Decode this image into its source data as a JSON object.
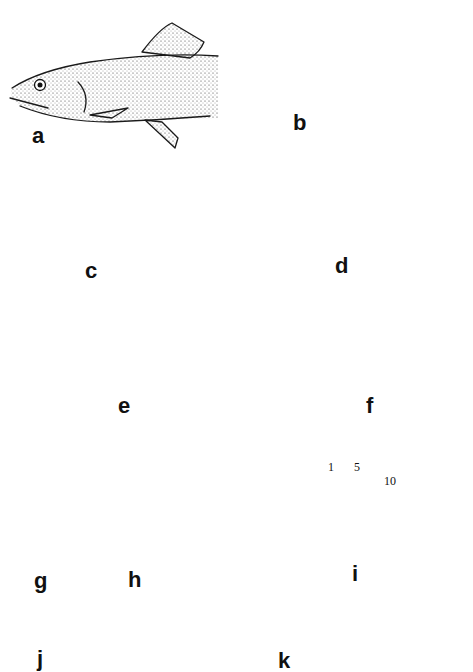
{
  "figure": {
    "type": "scientific-illustration-plate",
    "panels": [
      {
        "id": "a",
        "label": "a",
        "depicts": "head and anterior body of trout, fine stippling"
      },
      {
        "id": "b",
        "label": "b",
        "depicts": "head and anterior body of trout, spotted"
      },
      {
        "id": "c",
        "label": "c",
        "depicts": "outline of caudal region, shallow-forked tail"
      },
      {
        "id": "d",
        "label": "d",
        "depicts": "outline of caudal region, deeply forked tail"
      },
      {
        "id": "e",
        "label": "e",
        "depicts": "caudal peduncle with sparse ocellated spots"
      },
      {
        "id": "f",
        "label": "f",
        "depicts": "caudal peduncle with dense dark spots extending onto tail"
      },
      {
        "id": "g",
        "label": "g",
        "depicts": "gill arch with long rakers"
      },
      {
        "id": "h",
        "label": "h",
        "depicts": "gill arch with short rakers"
      },
      {
        "id": "i",
        "label": "i",
        "depicts": "scale rows counted above lateral line"
      },
      {
        "id": "j",
        "label": "j",
        "depicts": "basibranchial teeth detail"
      },
      {
        "id": "k",
        "label": "k",
        "depicts": "basibranchial teeth detail, fewer teeth"
      }
    ],
    "scale_count_ticks": [
      "1",
      "5",
      "10"
    ]
  }
}
